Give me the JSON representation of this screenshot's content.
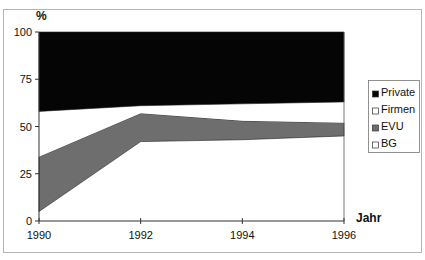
{
  "chart_data": {
    "type": "area",
    "stacked": true,
    "percent": true,
    "title": "",
    "xlabel": "Jahr",
    "ylabel": "%",
    "x": [
      1990,
      1992,
      1994,
      1996
    ],
    "x_tick_labels": [
      "1990",
      "1992",
      "1994",
      "1996"
    ],
    "y_tick_labels": [
      "0",
      "25",
      "50",
      "75",
      "100"
    ],
    "y_ticks": [
      0,
      25,
      50,
      75,
      100
    ],
    "ylim": [
      0,
      100
    ],
    "xlim": [
      1990,
      1996
    ],
    "grid": false,
    "legend_position": "right",
    "series": [
      {
        "name": "BG",
        "color": "#ffffff",
        "values": [
          5,
          42,
          43,
          45
        ]
      },
      {
        "name": "EVU",
        "color": "#6e6e6e",
        "values": [
          29,
          15,
          10,
          7
        ]
      },
      {
        "name": "Firmen",
        "color": "#ffffff",
        "values": [
          24,
          4,
          9,
          11
        ]
      },
      {
        "name": "Private",
        "color": "#050505",
        "values": [
          42,
          39,
          38,
          37
        ]
      }
    ],
    "legend_order": [
      "Private",
      "Firmen",
      "EVU",
      "BG"
    ]
  }
}
